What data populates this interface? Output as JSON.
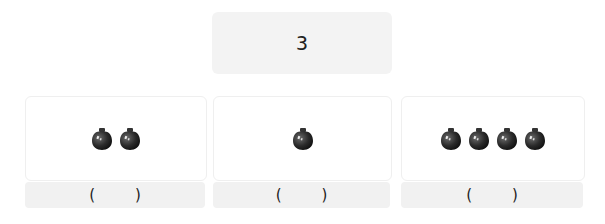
{
  "prompt": {
    "number": "3"
  },
  "groups": [
    {
      "apple_count": 2,
      "icon": "apple-icon",
      "answer": {
        "open": "(",
        "value": "",
        "close": ")"
      }
    },
    {
      "apple_count": 1,
      "icon": "apple-icon",
      "answer": {
        "open": "(",
        "value": "",
        "close": ")"
      }
    },
    {
      "apple_count": 4,
      "icon": "apple-icon",
      "answer": {
        "open": "(",
        "value": "",
        "close": ")"
      }
    }
  ],
  "colors": {
    "apple": "#2b2b2b",
    "box_bg": "#f3f3f3",
    "card_border": "#efefef"
  }
}
